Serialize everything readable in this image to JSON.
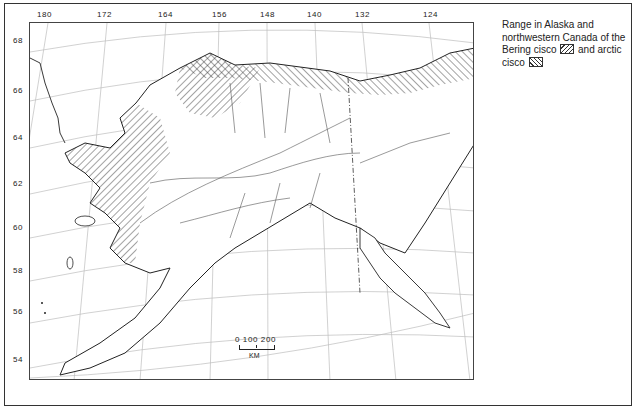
{
  "figure": {
    "type": "range map",
    "region": "Alaska and northwestern Canada"
  },
  "legend": {
    "text_before": "Range in Alaska and northwestern Canada of the Bering cisco",
    "text_middle": "and arctic cisco",
    "items": [
      {
        "species": "Bering cisco",
        "pattern": "diagonal hatching (///)"
      },
      {
        "species": "arctic cisco",
        "pattern": "diagonal hatching (\\\\\\)"
      }
    ]
  },
  "axes": {
    "longitude_labels": [
      "180",
      "172",
      "164",
      "156",
      "148",
      "140",
      "132",
      "124"
    ],
    "latitude_labels": [
      "68",
      "66",
      "64",
      "62",
      "60",
      "58",
      "56",
      "54"
    ]
  },
  "scale_bar": {
    "ticks": [
      "0",
      "100",
      "200"
    ],
    "ticks_text": "0  100 200",
    "unit": "KM"
  },
  "colors": {
    "ink": "#222222",
    "graticule": "#bbbbbb",
    "background": "#ffffff"
  }
}
